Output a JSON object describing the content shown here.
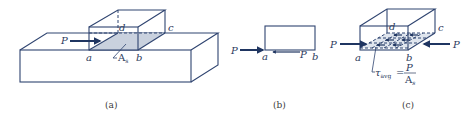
{
  "figure": {
    "panels": [
      {
        "id": "a",
        "caption": "(a)",
        "labels": {
          "force": "P",
          "a": "a",
          "b": "b",
          "c": "c",
          "d": "d",
          "area": "A",
          "area_sub": "s"
        }
      },
      {
        "id": "b",
        "caption": "(b)",
        "labels": {
          "force_left": "P",
          "force_bottom": "P",
          "a": "a",
          "b": "b"
        }
      },
      {
        "id": "c",
        "caption": "(c)",
        "labels": {
          "force_left": "P",
          "force_right": "P",
          "a": "a",
          "b": "b",
          "c": "c",
          "d": "d",
          "tau": "τ",
          "tau_sub": "avg",
          "equals": "=",
          "numerator": "P",
          "denominator": "A",
          "denominator_sub": "s"
        }
      }
    ],
    "colors": {
      "edge": "#2f4470",
      "arrow": "#1f3561",
      "shear_plane_fill": "#c9d1de",
      "shear_plane_c_fill": "#dfe5ee"
    }
  }
}
